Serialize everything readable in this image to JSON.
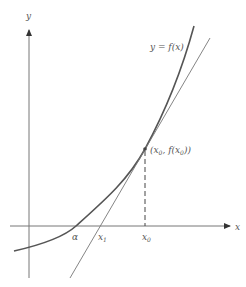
{
  "diagram": {
    "axes": {
      "x_label": "x",
      "y_label": "y"
    },
    "curve_label": "y = f(x)",
    "point_label": {
      "open": "(x",
      "sub0": "0",
      "comma": ", f(x",
      "sub1": "0",
      "close": "))"
    },
    "x_ticks": {
      "alpha": "α",
      "x1_base": "x",
      "x1_sub": "1",
      "x0_base": "x",
      "x0_sub": "0"
    },
    "colors": {
      "axis": "#666666",
      "curve": "#555555",
      "tangent": "#777777",
      "text": "#555555"
    }
  }
}
